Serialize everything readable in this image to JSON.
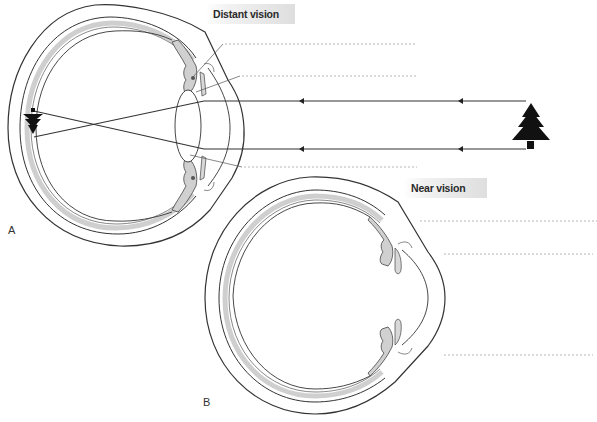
{
  "figure": {
    "panels": [
      {
        "id": "A",
        "letter": "A",
        "title": "Distant vision",
        "leader_lines": 3,
        "rays": {
          "count": 2,
          "direction": "right-to-left",
          "arrowheads_per_ray": 2
        },
        "object": "tree-icon",
        "image_on_retina": "inverted-tree-icon"
      },
      {
        "id": "B",
        "letter": "B",
        "title": "Near vision",
        "leader_lines": 3
      }
    ],
    "colors": {
      "outline": "#333333",
      "choroid_fill": "#cfcfcf",
      "ciliary_fill": "#d0d0d0",
      "label_gradient_end": "#dedede",
      "dotted_line": "#b5b5b5",
      "object_fill": "#111111"
    }
  }
}
